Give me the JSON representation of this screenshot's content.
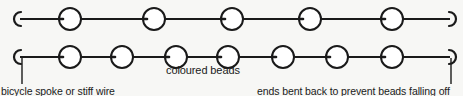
{
  "diagram": {
    "background_color": "#f7f7f5",
    "stroke_color": "#1a1a1a",
    "bead_fill": "#ffffff",
    "wires": [
      {
        "name": "top-wire",
        "y": 19,
        "x_start": 14,
        "x_end": 452,
        "bead_count": 5,
        "bead_radius": 11,
        "bead_centers": [
          70,
          154,
          232,
          310,
          392
        ],
        "left_end": "hook-open-right",
        "right_end": "hook-open-left"
      },
      {
        "name": "bottom-wire",
        "y": 57,
        "x_start": 14,
        "x_end": 452,
        "bead_count": 7,
        "bead_radius": 11,
        "bead_centers": [
          70,
          122,
          176,
          228,
          283,
          337,
          392
        ],
        "left_end": "hook-open-right",
        "right_end": "hook-open-left"
      }
    ],
    "leader_lines": [
      {
        "name": "leader-line-left",
        "x": 22,
        "y_top": 57,
        "y_bottom": 84
      },
      {
        "name": "leader-line-right",
        "x": 451,
        "y_top": 57,
        "y_bottom": 84
      }
    ],
    "captions": {
      "beads": "coloured beads",
      "spoke": "bicycle spoke or stiff wire",
      "ends": "ends bent back to prevent beads falling off"
    }
  }
}
